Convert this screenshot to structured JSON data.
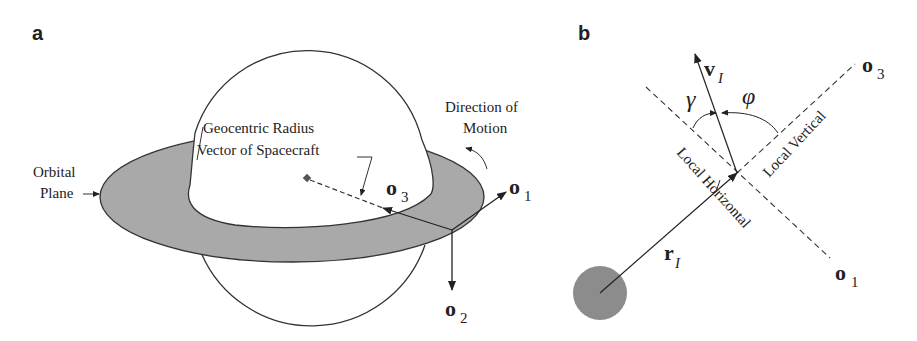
{
  "panels": {
    "a": {
      "label": "a",
      "labels": {
        "geocentric_line1": "Geocentric Radius",
        "geocentric_line2": "Vector of Spacecraft",
        "direction_line1": "Direction of",
        "direction_line2": "Motion",
        "orbital_line1": "Orbital",
        "orbital_line2": "Plane"
      },
      "axes": {
        "o1": {
          "base": "o",
          "sub": "1"
        },
        "o2": {
          "base": "o",
          "sub": "2"
        },
        "o3": {
          "base": "o",
          "sub": "3"
        }
      },
      "colors": {
        "orbital_plane": "#a9a9a9",
        "earth": "#ffffff",
        "stroke": "#333333"
      }
    },
    "b": {
      "label": "b",
      "labels": {
        "local_vertical": "Local Vertical",
        "local_horizontal": "Local Horizontal"
      },
      "vectors": {
        "v": {
          "base": "v",
          "sub": "I"
        },
        "r": {
          "base": "r",
          "sub": "I"
        },
        "o1": {
          "base": "o",
          "sub": "1"
        },
        "o3": {
          "base": "o",
          "sub": "3"
        }
      },
      "angles": {
        "gamma": "γ",
        "phi": "φ"
      },
      "colors": {
        "earth": "#8c8c8c",
        "stroke": "#333333"
      }
    }
  }
}
